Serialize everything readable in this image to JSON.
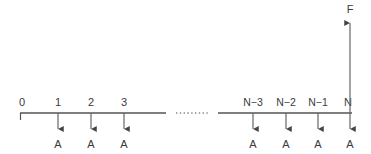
{
  "figure": {
    "colors": {
      "line": "#555555",
      "text": "#3a3a3a",
      "background": "#ffffff"
    },
    "axis": {
      "left_segment": {
        "x_start": 20,
        "x_end": 166,
        "y": 113
      },
      "right_segment": {
        "x_start": 218,
        "x_end": 352,
        "y": 113
      },
      "left_end_tick": {
        "x": 20,
        "y_top": 113,
        "y_bottom": 120
      },
      "ellipsis_dots": {
        "x_start": 176,
        "x_end": 208,
        "y": 113,
        "count": 9
      }
    },
    "nodes": [
      {
        "id": "node-0",
        "label": "0",
        "x": 22,
        "has_load_arrow": false
      },
      {
        "id": "node-1",
        "label": "1",
        "x": 58,
        "has_load_arrow": true
      },
      {
        "id": "node-2",
        "label": "2",
        "x": 91,
        "has_load_arrow": true
      },
      {
        "id": "node-3",
        "label": "3",
        "x": 124,
        "has_load_arrow": true
      },
      {
        "id": "node-n-3",
        "label": "N−3",
        "x": 253,
        "has_load_arrow": true
      },
      {
        "id": "node-n-2",
        "label": "N−2",
        "x": 286,
        "has_load_arrow": true
      },
      {
        "id": "node-n-1",
        "label": "N−1",
        "x": 318,
        "has_load_arrow": true
      },
      {
        "id": "node-n",
        "label": "N",
        "x": 350,
        "has_load_arrow": true
      }
    ],
    "load_arrow": {
      "label": "A",
      "y_start": 113,
      "y_tip": 134,
      "label_y": 148
    },
    "node_label_y": 106,
    "force_arrow": {
      "label": "F",
      "x": 350,
      "y_tip": 18,
      "y_start": 113,
      "label_y": 13
    }
  }
}
